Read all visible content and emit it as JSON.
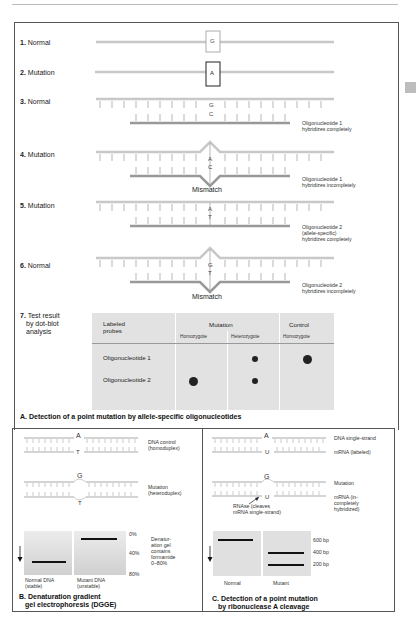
{
  "panel_a": {
    "rows": [
      {
        "num": "1.",
        "label": "Normal",
        "base_top": "G"
      },
      {
        "num": "2.",
        "label": "Mutation",
        "base_top": "A"
      },
      {
        "num": "3.",
        "label": "Normal",
        "base_top": "G",
        "base_bottom": "C",
        "note": [
          "Oligonucleotide 1",
          "hybridizes completely"
        ]
      },
      {
        "num": "4.",
        "label": "Mutation",
        "base_top": "A",
        "base_bottom": "C",
        "mismatch": "Mismatch",
        "note": [
          "Oligonucleotide 1",
          "hybridizes incompletely"
        ]
      },
      {
        "num": "5.",
        "label": "Mutation",
        "base_top": "A",
        "base_bottom": "T",
        "note": [
          "Oligonucleotide 2",
          "(allele-specific)",
          "hybridizes completely"
        ]
      },
      {
        "num": "6.",
        "label": "Normal",
        "base_top": "G",
        "base_bottom": "T",
        "mismatch": "Mismatch",
        "note": [
          "Oligonucleotide 2",
          "hybridizes incompletely"
        ]
      },
      {
        "num": "7.",
        "label_lines": [
          "Test result",
          "by dot-blot",
          "analysis"
        ]
      }
    ],
    "table": {
      "header_probe": [
        "Labeled",
        "probes"
      ],
      "header_mutation": "Mutation",
      "header_control": "Control",
      "sub_headers": [
        "Homozygote",
        "Heterozygote",
        "Homozygote"
      ],
      "rows": [
        {
          "probe": "Oligonucleotide 1",
          "dots": [
            false,
            "small",
            "large"
          ]
        },
        {
          "probe": "Oligonucleotide 2",
          "dots": [
            "large",
            "small",
            false
          ]
        }
      ]
    },
    "caption": "A. Detection of a point mutation by allele-specific oligonucleotides"
  },
  "panel_b": {
    "control": {
      "top": "A",
      "bottom": "T",
      "label": [
        "DNA control",
        "(homoduplex)"
      ]
    },
    "mutation": {
      "top": "G",
      "bottom": "T",
      "label": [
        "Mutation",
        "(heteroduplex)"
      ]
    },
    "gel_scale": [
      "0%",
      "40%",
      "80%"
    ],
    "gel_note": [
      "Denatur-",
      "ation gel",
      "contains",
      "formamide",
      "0–80%"
    ],
    "lanes": [
      {
        "label": [
          "Normal DNA",
          "(stable)"
        ]
      },
      {
        "label": [
          "Mutant DNA",
          "(unstable)"
        ]
      }
    ],
    "caption": [
      "B. Denaturation gradient",
      "gel electrophoresis (DGGE)"
    ]
  },
  "panel_c": {
    "control": {
      "top": "A",
      "bottom": "U",
      "label_top": "DNA single-strand",
      "label_bottom": "mRNA (labeled)"
    },
    "mutation": {
      "top": "G",
      "bottom": "U",
      "label_top": "Mutation",
      "label_bottom": [
        "mRNA (in-",
        "completely",
        "hybridized)"
      ]
    },
    "rnase_note": [
      "RNAse (cleaves",
      "mRNA single-strand)"
    ],
    "sizes": [
      "600 bp",
      "400 bp",
      "200 bp"
    ],
    "lanes": [
      "Normal",
      "Mutant"
    ],
    "caption": [
      "C. Detection of a point mutation",
      "by ribonuclease A cleavage"
    ]
  }
}
